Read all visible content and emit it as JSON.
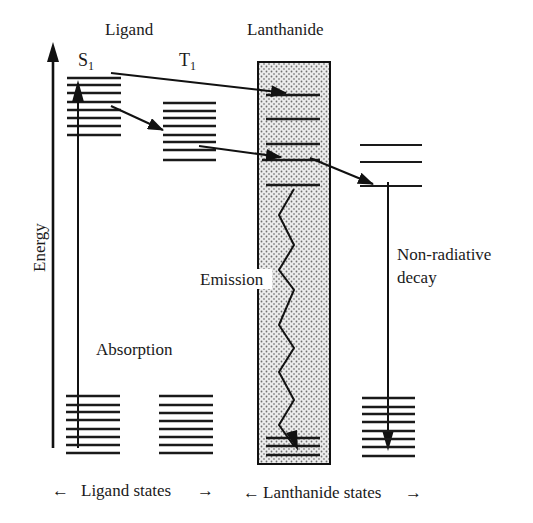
{
  "diagram": {
    "title_ligand": "Ligand",
    "title_lanthanide": "Lanthanide",
    "state_s1": "S",
    "state_s1_sub": "1",
    "state_t1": "T",
    "state_t1_sub": "1",
    "axis_label": "Energy",
    "absorption_label": "Absorption",
    "emission_label": "Emission",
    "nonradiative_label_line1": "Non-radiative",
    "nonradiative_label_line2": "decay",
    "footer_ligand": "Ligand states",
    "footer_lanthanide": "Lanthanide states",
    "arrow_left_glyph": "←",
    "arrow_right_glyph": "→",
    "colors": {
      "ink": "#1a1a1a",
      "box_fill": "#e6e6e6",
      "dot": "#6e6e6e",
      "background": "#ffffff"
    }
  }
}
